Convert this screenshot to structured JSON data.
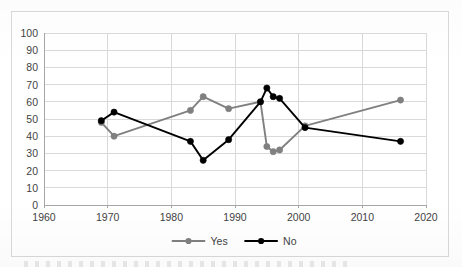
{
  "chart_data": {
    "type": "line",
    "title": "",
    "subtitle": "",
    "xlabel": "",
    "ylabel": "",
    "xlim": [
      1960,
      2020
    ],
    "ylim": [
      0,
      100
    ],
    "xticks": [
      1960,
      1970,
      1980,
      1990,
      2000,
      2010,
      2020
    ],
    "yticks": [
      0,
      10,
      20,
      30,
      40,
      50,
      60,
      70,
      80,
      90,
      100
    ],
    "grid": true,
    "legend_position": "bottom",
    "markers": "circle",
    "series": [
      {
        "name": "Yes",
        "color": "#808080",
        "x": [
          1969,
          1971,
          1983,
          1985,
          1989,
          1994,
          1995,
          1996,
          1997,
          2001,
          2016
        ],
        "values": [
          48,
          40,
          55,
          63,
          56,
          60,
          34,
          31,
          32,
          46,
          61
        ]
      },
      {
        "name": "No",
        "color": "#000000",
        "x": [
          1969,
          1971,
          1983,
          1985,
          1989,
          1994,
          1995,
          1996,
          1997,
          2001,
          2016
        ],
        "values": [
          49,
          54,
          37,
          26,
          38,
          60,
          68,
          63,
          62,
          45,
          37
        ]
      }
    ]
  },
  "legend": {
    "items": [
      {
        "label": "Yes",
        "color": "#808080"
      },
      {
        "label": "No",
        "color": "#000000"
      }
    ]
  },
  "axis": {
    "y_labels": [
      "100",
      "90",
      "80",
      "70",
      "60",
      "50",
      "40",
      "30",
      "20",
      "10",
      "0"
    ],
    "x_labels": [
      "1960",
      "1970",
      "1980",
      "1990",
      "2000",
      "2010",
      "2020"
    ]
  },
  "colors": {
    "yes": "#808080",
    "no": "#000000",
    "grid": "#d9d9d9",
    "frame": "#d9d9d9",
    "text": "#3f3f3f"
  }
}
